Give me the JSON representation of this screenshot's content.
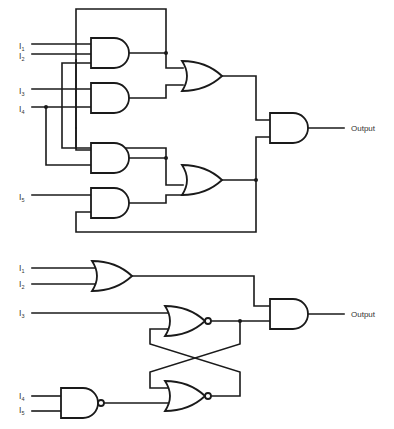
{
  "figure": {
    "top_circuit": {
      "inputs": [
        {
          "label": "I",
          "sub": "1"
        },
        {
          "label": "I",
          "sub": "2"
        },
        {
          "label": "I",
          "sub": "3"
        },
        {
          "label": "I",
          "sub": "4"
        },
        {
          "label": "I",
          "sub": "5"
        }
      ],
      "gates": [
        "AND",
        "AND",
        "AND",
        "AND",
        "OR",
        "OR",
        "AND"
      ],
      "output_label": "Output"
    },
    "bottom_circuit": {
      "inputs": [
        {
          "label": "I",
          "sub": "1"
        },
        {
          "label": "I",
          "sub": "2"
        },
        {
          "label": "I",
          "sub": "3"
        },
        {
          "label": "I",
          "sub": "4"
        },
        {
          "label": "I",
          "sub": "5"
        }
      ],
      "gates": [
        "OR",
        "NOR",
        "NOR",
        "NAND",
        "AND"
      ],
      "output_label": "Output"
    }
  }
}
